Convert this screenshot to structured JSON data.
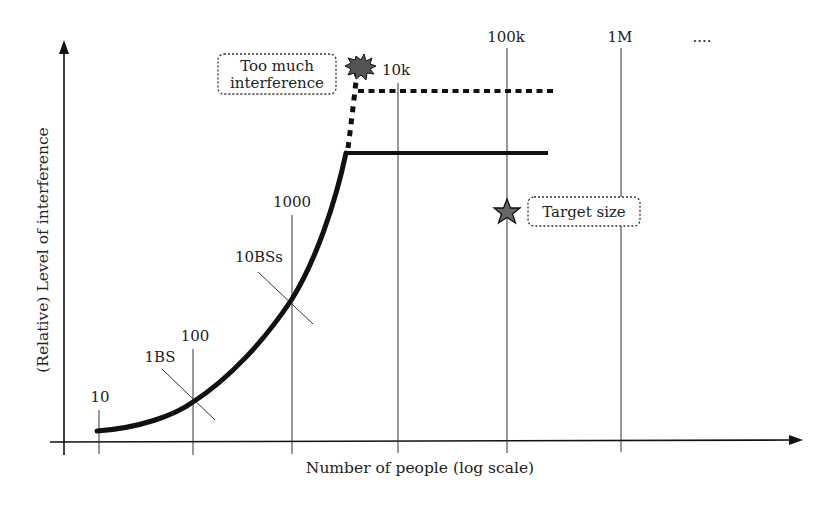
{
  "diagram": {
    "y_axis_label": "(Relative) Level of interference",
    "x_axis_label": "Number of people (log scale)",
    "ticks": [
      {
        "label": "10",
        "x": 99
      },
      {
        "label": "100",
        "x": 193
      },
      {
        "label": "1000",
        "x": 292
      },
      {
        "label": "10k",
        "x": 398
      },
      {
        "label": "100k",
        "x": 507
      },
      {
        "label": "1M",
        "x": 621
      }
    ],
    "continuation": "....",
    "markers": {
      "one_bs": "1BS",
      "ten_bss": "10BSs"
    },
    "callouts": {
      "too_much_line1": "Too much",
      "too_much_line2": "interference",
      "target": "Target size"
    },
    "colors": {
      "line": "#111111",
      "grid": "#333333",
      "burst_fill": "#555555",
      "star_fill": "#666666"
    }
  }
}
